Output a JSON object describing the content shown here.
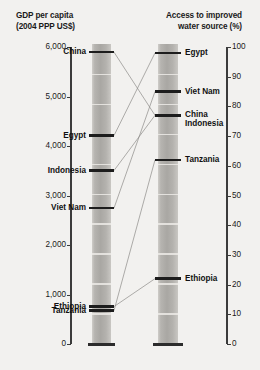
{
  "chart_data": {
    "type": "line",
    "title": "",
    "axes": [
      {
        "id": "gdp",
        "label": "GDP per capita\n(2004 PPP US$)",
        "label_line1": "GDP per capita",
        "label_line2": "(2004 PPP US$)",
        "unit": "PPP US$",
        "range": [
          0,
          6000
        ],
        "ticks": [
          0,
          1000,
          2000,
          3000,
          4000,
          5000,
          6000
        ],
        "tick_labels": [
          "0",
          "1,000",
          "2,000",
          "3,000",
          "4,000",
          "5,000",
          "6,000"
        ],
        "side": "left"
      },
      {
        "id": "water",
        "label": "Access to improved\nwater source (%)",
        "label_line1": "Access to improved",
        "label_line2": "water source (%)",
        "unit": "%",
        "range": [
          0,
          100
        ],
        "ticks": [
          0,
          10,
          20,
          30,
          40,
          50,
          60,
          70,
          80,
          90,
          100
        ],
        "tick_labels": [
          "0",
          "10",
          "20",
          "30",
          "40",
          "50",
          "60",
          "70",
          "80",
          "90",
          "100"
        ],
        "side": "right"
      }
    ],
    "series_name": "country",
    "countries": [
      {
        "name": "China",
        "gdp": 5896,
        "water": 77
      },
      {
        "name": "Egypt",
        "gdp": 4211,
        "water": 98
      },
      {
        "name": "Indonesia",
        "gdp": 3504,
        "water": 77
      },
      {
        "name": "Viet Nam",
        "gdp": 2745,
        "water": 85
      },
      {
        "name": "Ethiopia",
        "gdp": 756,
        "water": 22
      },
      {
        "name": "Tanzania",
        "gdp": 674,
        "water": 62
      }
    ],
    "gdp_markers": [
      {
        "label": "China",
        "value": 5896,
        "label_lines": [
          "China"
        ]
      },
      {
        "label": "Egypt",
        "value": 4211,
        "label_lines": [
          "Egypt"
        ]
      },
      {
        "label": "Indonesia",
        "value": 3504,
        "label_lines": [
          "Indonesia"
        ]
      },
      {
        "label": "Viet Nam",
        "value": 2745,
        "label_lines": [
          "Viet Nam"
        ]
      },
      {
        "label": "Ethiopia",
        "value": 756,
        "label_lines": [
          "Ethiopia"
        ]
      },
      {
        "label": "Tanzania",
        "value": 674,
        "label_lines": [
          "Tanzania"
        ]
      }
    ],
    "water_markers": [
      {
        "label": "Egypt",
        "value": 98,
        "label_lines": [
          "Egypt"
        ]
      },
      {
        "label": "Viet Nam",
        "value": 85,
        "label_lines": [
          "Viet Nam"
        ]
      },
      {
        "label": "China / Indonesia",
        "value": 77,
        "label_lines": [
          "China",
          "Indonesia"
        ]
      },
      {
        "label": "Tanzania",
        "value": 62,
        "label_lines": [
          "Tanzania"
        ]
      },
      {
        "label": "Ethiopia",
        "value": 22,
        "label_lines": [
          "Ethiopia"
        ]
      }
    ],
    "colors": {
      "background": "#f2f1ef",
      "bar": "#b0aeaa",
      "marker": "#1d1d1d",
      "connector": "#8d8b88",
      "axis": "#3b3b3b",
      "text": "#1a1a1a"
    },
    "grid": false,
    "legend": "none"
  },
  "gdp_axis": {
    "heading_line1": "GDP per capita",
    "heading_line2": "(2004 PPP US$)"
  },
  "water_axis": {
    "heading_line1": "Access to improved",
    "heading_line2": "water source (%)"
  }
}
